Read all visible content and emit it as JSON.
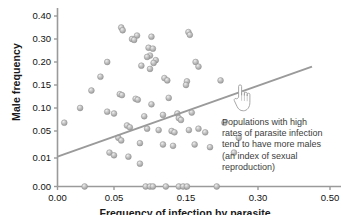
{
  "chart_data": {
    "type": "scatter",
    "title": "",
    "xlabel": "Frequency of infection by parasite",
    "ylabel": "Male frequency",
    "xlim": [
      0.0,
      0.5
    ],
    "ylim": [
      0.0,
      0.4
    ],
    "grid": false,
    "legend": "none",
    "axis_note": "Both axes use non-uniform (compressed) tick spacing",
    "xticks": [
      "0.00",
      "0.05",
      "0.15",
      "0.30",
      "0.50"
    ],
    "yticks": [
      "0.00",
      "0.01",
      "0.05",
      "0.10",
      "0.15",
      "0.20",
      "0.30",
      "0.40"
    ],
    "marker_color": "#b2b2b2",
    "line_color": "#9a9a9a",
    "trendline": {
      "name": "linear fit",
      "x": [
        0.0,
        0.45
      ],
      "y": [
        0.012,
        0.19
      ]
    },
    "series": [
      {
        "name": "populations",
        "points": [
          [
            0.06,
            0.35
          ],
          [
            0.062,
            0.338
          ],
          [
            0.082,
            0.315
          ],
          [
            0.075,
            0.3
          ],
          [
            0.078,
            0.296
          ],
          [
            0.102,
            0.31
          ],
          [
            0.098,
            0.262
          ],
          [
            0.104,
            0.258
          ],
          [
            0.155,
            0.33
          ],
          [
            0.158,
            0.318
          ],
          [
            0.1,
            0.228
          ],
          [
            0.096,
            0.222
          ],
          [
            0.108,
            0.208
          ],
          [
            0.105,
            0.198
          ],
          [
            0.044,
            0.2
          ],
          [
            0.088,
            0.192
          ],
          [
            0.1,
            0.185
          ],
          [
            0.17,
            0.2
          ],
          [
            0.176,
            0.19
          ],
          [
            0.038,
            0.168
          ],
          [
            0.12,
            0.165
          ],
          [
            0.124,
            0.16
          ],
          [
            0.152,
            0.158
          ],
          [
            0.15,
            0.15
          ],
          [
            0.222,
            0.16
          ],
          [
            0.03,
            0.138
          ],
          [
            0.058,
            0.13
          ],
          [
            0.061,
            0.128
          ],
          [
            0.08,
            0.12
          ],
          [
            0.083,
            0.118
          ],
          [
            0.126,
            0.122
          ],
          [
            0.102,
            0.108
          ],
          [
            0.02,
            0.1
          ],
          [
            0.044,
            0.092
          ],
          [
            0.05,
            0.088
          ],
          [
            0.092,
            0.082
          ],
          [
            0.118,
            0.085
          ],
          [
            0.138,
            0.088
          ],
          [
            0.162,
            0.09
          ],
          [
            0.14,
            0.078
          ],
          [
            0.143,
            0.074
          ],
          [
            0.006,
            0.068
          ],
          [
            0.068,
            0.062
          ],
          [
            0.072,
            0.058
          ],
          [
            0.096,
            0.055
          ],
          [
            0.112,
            0.052
          ],
          [
            0.13,
            0.05
          ],
          [
            0.134,
            0.048
          ],
          [
            0.156,
            0.052
          ],
          [
            0.176,
            0.055
          ],
          [
            0.19,
            0.048
          ],
          [
            0.23,
            0.068
          ],
          [
            0.056,
            0.04
          ],
          [
            0.06,
            0.036
          ],
          [
            0.086,
            0.032
          ],
          [
            0.118,
            0.03
          ],
          [
            0.132,
            0.028
          ],
          [
            0.168,
            0.03
          ],
          [
            0.2,
            0.026
          ],
          [
            0.26,
            0.04
          ],
          [
            0.046,
            0.018
          ],
          [
            0.05,
            0.014
          ],
          [
            0.07,
            0.012
          ],
          [
            0.25,
            0.018
          ],
          [
            0.086,
            0.008
          ],
          [
            0.024,
            0.0
          ],
          [
            0.094,
            0.0
          ],
          [
            0.1,
            0.0
          ],
          [
            0.104,
            0.0
          ],
          [
            0.122,
            0.0
          ],
          [
            0.14,
            0.0
          ],
          [
            0.146,
            0.0
          ],
          [
            0.152,
            0.0
          ],
          [
            0.214,
            0.0
          ]
        ]
      }
    ],
    "annotation": {
      "text": "Populations with high\nrates of parasite infection\ntend to have more males\n(an index of sexual\nreproduction)",
      "cursor_icon": "pointing-hand-cursor"
    }
  }
}
